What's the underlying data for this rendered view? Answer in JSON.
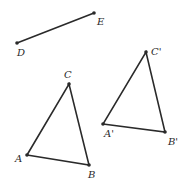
{
  "diagram": {
    "segment_de": {
      "points": {
        "D": {
          "label": "D",
          "x": 17,
          "y": 43,
          "lx": 17,
          "ly": 56
        },
        "E": {
          "label": "E",
          "x": 94,
          "y": 13,
          "lx": 97,
          "ly": 25
        }
      }
    },
    "triangle_abc": {
      "points": {
        "A": {
          "label": "A",
          "x": 27,
          "y": 155,
          "lx": 15,
          "ly": 162
        },
        "B": {
          "label": "B",
          "x": 89,
          "y": 165,
          "lx": 88,
          "ly": 178
        },
        "C": {
          "label": "C",
          "x": 69,
          "y": 84,
          "lx": 64,
          "ly": 78
        }
      }
    },
    "triangle_abc_prime": {
      "points": {
        "A": {
          "label": "A'",
          "x": 103,
          "y": 124,
          "lx": 104,
          "ly": 137
        },
        "B": {
          "label": "B'",
          "x": 165,
          "y": 132,
          "lx": 168,
          "ly": 145
        },
        "C": {
          "label": "C'",
          "x": 146,
          "y": 52,
          "lx": 151,
          "ly": 55
        }
      }
    }
  }
}
